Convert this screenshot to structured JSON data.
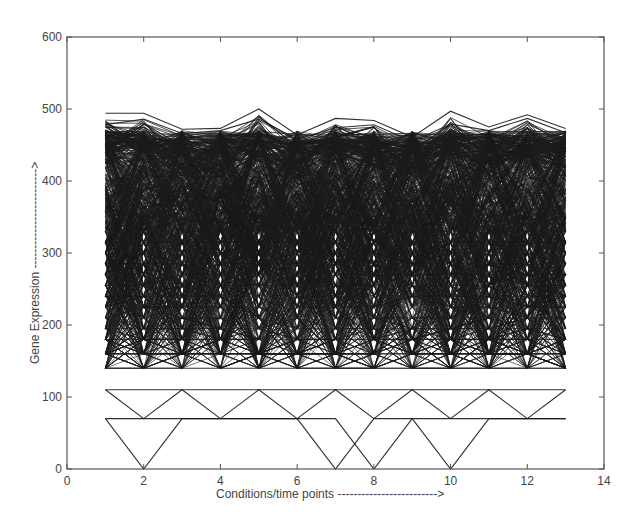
{
  "chart_data": {
    "type": "line",
    "title": "",
    "xlabel": "Conditions/time points",
    "xlabel_arrow": "------------------------->",
    "ylabel": "Gene Expression",
    "ylabel_arrow": "------------------------->",
    "xlim": [
      0,
      14
    ],
    "ylim": [
      0,
      600
    ],
    "xticks": [
      0,
      2,
      4,
      6,
      8,
      10,
      12,
      14
    ],
    "yticks": [
      0,
      100,
      200,
      300,
      400,
      500,
      600
    ],
    "grid": false,
    "legend": null,
    "x": [
      1,
      2,
      3,
      4,
      5,
      6,
      7,
      8,
      9,
      10,
      11,
      12,
      13
    ],
    "series_description": "Hundreds of gene expression profiles plotted as black lines across 13 conditions; values are quantized to discrete levels between ~70 and ~500, forming a dense band from ~140 to ~470.",
    "series": [
      {
        "name": "top-profile",
        "values": [
          494,
          494,
          472,
          473,
          500,
          464,
          487,
          484,
          461,
          497,
          475,
          492,
          473
        ]
      },
      {
        "name": "second-profile",
        "values": [
          478,
          486,
          466,
          470,
          486,
          458,
          474,
          478,
          455,
          479,
          470,
          487,
          467
        ]
      },
      {
        "name": "lowest-profile",
        "values": [
          70,
          0,
          70,
          70,
          70,
          70,
          0,
          70,
          70,
          0,
          70,
          70,
          70
        ]
      },
      {
        "name": "low-profile-b",
        "values": [
          70,
          70,
          70,
          70,
          70,
          70,
          70,
          0,
          70,
          70,
          70,
          70,
          70
        ]
      },
      {
        "name": "low-profile-c",
        "values": [
          110,
          70,
          110,
          70,
          110,
          70,
          110,
          70,
          110,
          70,
          110,
          70,
          110
        ]
      },
      {
        "name": "flat-110",
        "values": [
          110,
          110,
          110,
          110,
          110,
          110,
          110,
          110,
          110,
          110,
          110,
          110,
          110
        ]
      },
      {
        "name": "flat-140",
        "values": [
          140,
          140,
          140,
          140,
          140,
          140,
          140,
          140,
          140,
          140,
          140,
          140,
          140
        ]
      }
    ],
    "quantized_levels": [
      0,
      70,
      110,
      140,
      160,
      180,
      195,
      210,
      225,
      240,
      255,
      270,
      285,
      300,
      315,
      330,
      345,
      360,
      375,
      390,
      405,
      420,
      435,
      450
    ],
    "generated_profile_count": 700
  },
  "colors": {
    "line": "#1a1a1a",
    "axis": "#555555",
    "background": "#ffffff"
  }
}
